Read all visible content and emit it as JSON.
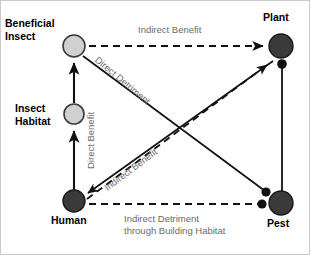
{
  "diagram": {
    "colors": {
      "light_node_fill": "#d0d0d0",
      "light_node_stroke": "#3a3a3a",
      "dark_node_fill": "#3a3a3a",
      "dark_node_stroke": "#1a1a1a",
      "edge_color": "#111111",
      "edge_label_color": "#6b6b6b",
      "node_label_color": "#000000",
      "background": "#ffffff",
      "border": "#c9c9c9"
    },
    "nodes": [
      {
        "id": "beneficial-insect",
        "label": "Beneficial\nInsect",
        "x": 73,
        "y": 45,
        "r": 11,
        "style": "light"
      },
      {
        "id": "insect-habitat",
        "label": "Insect\nHabitat",
        "x": 73,
        "y": 113,
        "r": 10,
        "style": "light"
      },
      {
        "id": "human",
        "label": "Human",
        "x": 73,
        "y": 200,
        "r": 11,
        "style": "dark"
      },
      {
        "id": "plant",
        "label": "Plant",
        "x": 280,
        "y": 45,
        "r": 12,
        "style": "dark"
      },
      {
        "id": "pest",
        "label": "Pest",
        "x": 280,
        "y": 202,
        "r": 12,
        "style": "dark"
      }
    ],
    "edges": [
      {
        "id": "insect-habitat-to-beneficial-insect",
        "from": "insect-habitat",
        "to": "beneficial-insect",
        "line": "solid",
        "ending": "arrow",
        "label": "Direct Benefit"
      },
      {
        "id": "human-to-insect-habitat",
        "from": "human",
        "to": "insect-habitat",
        "line": "solid",
        "ending": "arrow",
        "label": "Direct Benefit"
      },
      {
        "id": "beneficial-insect-to-plant",
        "from": "beneficial-insect",
        "to": "plant",
        "line": "dashed",
        "ending": "arrow",
        "label": "Indirect Benefit"
      },
      {
        "id": "beneficial-insect-to-pest",
        "from": "beneficial-insect",
        "to": "pest",
        "line": "solid",
        "ending": "blunt-dot",
        "label": "Direct Detriment"
      },
      {
        "id": "pest-to-human",
        "from": "pest",
        "to": "human",
        "line": "solid",
        "ending": "arrow",
        "label": ""
      },
      {
        "id": "human-to-plant",
        "from": "human",
        "to": "plant",
        "line": "dashed",
        "ending": "arrow",
        "label": "Indirect Benefit"
      },
      {
        "id": "pest-to-plant",
        "from": "pest",
        "to": "plant",
        "line": "solid",
        "ending": "blunt-dot",
        "label": ""
      },
      {
        "id": "human-to-pest",
        "from": "human",
        "to": "pest",
        "line": "dashed",
        "ending": "blunt-dot",
        "label": "Indirect Detriment\nthrough Building Habitat"
      }
    ],
    "node_labels": {
      "beneficial_insect": "Beneficial\nInsect",
      "insect_habitat": "Insect\nHabitat",
      "human": "Human",
      "plant": "Plant",
      "pest": "Pest"
    },
    "edge_labels": {
      "indirect_benefit_top": "Indirect Benefit",
      "direct_detriment": "Direct Detriment",
      "direct_benefit": "Direct Benefit",
      "indirect_benefit_diag": "Indirect Benefit",
      "indirect_detriment": "Indirect Detriment\nthrough Building Habitat"
    }
  }
}
